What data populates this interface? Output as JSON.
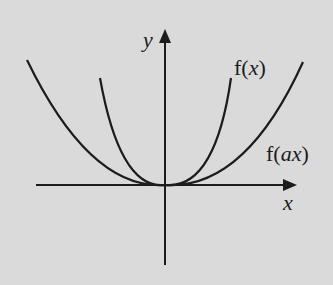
{
  "diagram": {
    "background": "#dadada",
    "stroke_color": "#1c1c1c",
    "axes": {
      "x_label": "x",
      "y_label": "y"
    },
    "curves": [
      {
        "name": "f(x)",
        "label_prefix": "f(",
        "label_var": "x",
        "label_suffix": ")",
        "description": "narrower parabola-like curve through origin"
      },
      {
        "name": "f(ax)",
        "label_prefix": "f(",
        "label_var": "ax",
        "label_suffix": ")",
        "description": "wider parabola-like curve through origin"
      }
    ]
  }
}
